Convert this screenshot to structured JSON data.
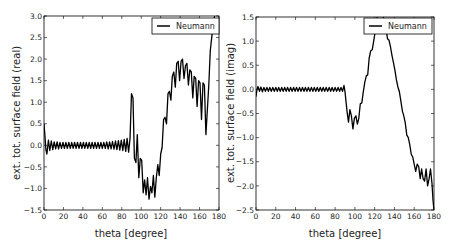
{
  "chart_data": [
    {
      "type": "line",
      "title": "",
      "xlabel": "theta [degree]",
      "ylabel": "ext. tot. surface field (real)",
      "xlim": [
        0,
        180
      ],
      "ylim": [
        -1.5,
        3.0
      ],
      "xticks": [
        0,
        20,
        40,
        60,
        80,
        100,
        120,
        140,
        160,
        180
      ],
      "yticks": [
        -1.5,
        -1.0,
        -0.5,
        0.0,
        0.5,
        1.0,
        1.5,
        2.0,
        2.5,
        3.0
      ],
      "ytick_labels": [
        "−1.5",
        "−1.0",
        "−0.5",
        "0.0",
        "0.5",
        "1.0",
        "1.5",
        "2.0",
        "2.5",
        "3.0"
      ],
      "xtick_labels": [
        "0",
        "20",
        "40",
        "60",
        "80",
        "100",
        "120",
        "140",
        "160",
        "180"
      ],
      "grid": false,
      "legend_position": "upper right",
      "series": [
        {
          "name": "Neumann",
          "color": "#000000",
          "x": [
            0,
            1,
            2,
            3,
            4.5,
            6,
            7.5,
            9,
            10.5,
            12,
            13.5,
            15,
            16.5,
            18,
            19.5,
            21,
            22.5,
            24,
            25.5,
            27,
            28.5,
            30,
            31.5,
            33,
            34.5,
            36,
            37.5,
            39,
            40.5,
            42,
            43.5,
            45,
            46.5,
            48,
            49.5,
            51,
            52.5,
            54,
            55.5,
            57,
            58.5,
            60,
            61.5,
            63,
            64.5,
            66,
            67.5,
            69,
            70.5,
            72,
            73.5,
            75,
            76.5,
            78,
            79.5,
            81,
            82.5,
            84,
            85.5,
            87,
            88.5,
            90,
            91.5,
            93,
            94.5,
            96,
            97.5,
            99,
            100.5,
            102,
            103.5,
            105,
            106.5,
            108,
            109.5,
            111,
            112.5,
            114,
            115.5,
            117,
            118.5,
            120,
            121.5,
            123,
            124.5,
            126,
            127.5,
            129,
            130.5,
            132,
            133.5,
            135,
            136.5,
            138,
            139.5,
            141,
            142.5,
            144,
            145.5,
            147,
            148.5,
            150,
            151.5,
            153,
            154.5,
            156,
            157.5,
            159,
            160.5,
            162,
            163.5,
            165,
            166.5,
            168,
            169.5,
            171,
            172.5,
            174,
            175.5,
            177,
            178,
            179,
            180
          ],
          "y": [
            0.5,
            0.2,
            -0.1,
            -0.2,
            0.12,
            -0.12,
            0.1,
            -0.1,
            0.08,
            -0.08,
            0.08,
            -0.08,
            0.07,
            -0.07,
            0.07,
            -0.07,
            0.07,
            -0.07,
            0.07,
            -0.07,
            0.07,
            -0.07,
            0.07,
            -0.07,
            0.07,
            -0.07,
            0.07,
            -0.07,
            0.07,
            -0.07,
            0.07,
            -0.07,
            0.07,
            -0.07,
            0.07,
            -0.07,
            0.07,
            -0.07,
            0.07,
            -0.07,
            0.07,
            -0.07,
            0.07,
            -0.07,
            0.08,
            -0.08,
            0.08,
            -0.08,
            0.09,
            -0.09,
            0.1,
            -0.1,
            0.11,
            -0.11,
            0.12,
            -0.12,
            0.14,
            -0.14,
            0.16,
            -0.16,
            0.15,
            1.2,
            1.1,
            -0.3,
            -0.4,
            0.25,
            -0.75,
            -0.3,
            -0.35,
            -1.1,
            -0.8,
            -1.15,
            -0.75,
            -1.25,
            -0.95,
            -1.1,
            -0.7,
            -1.2,
            -0.75,
            -0.45,
            -0.7,
            -0.2,
            -0.05,
            0.6,
            0.65,
            0.5,
            1.2,
            1.25,
            1.05,
            1.6,
            1.7,
            1.35,
            1.9,
            1.95,
            1.5,
            1.95,
            2.0,
            1.55,
            1.85,
            1.9,
            1.4,
            1.75,
            1.7,
            1.1,
            1.6,
            1.55,
            0.9,
            1.5,
            1.45,
            0.6,
            1.45,
            1.4,
            0.25,
            0.8,
            1.4,
            2.2,
            2.5,
            2.8,
            3.0
          ],
          "note": "x/y arrays after 87 are approximate traces of dense oscillation"
        }
      ]
    },
    {
      "type": "line",
      "title": "",
      "xlabel": "theta [degree]",
      "ylabel": "ext. tot. surface field (imag)",
      "xlim": [
        0,
        180
      ],
      "ylim": [
        -2.5,
        1.5
      ],
      "xticks": [
        0,
        20,
        40,
        60,
        80,
        100,
        120,
        140,
        160,
        180
      ],
      "yticks": [
        -2.5,
        -2.0,
        -1.5,
        -1.0,
        -0.5,
        0.0,
        0.5,
        1.0,
        1.5
      ],
      "ytick_labels": [
        "−2.5",
        "−2.0",
        "−1.5",
        "−1.0",
        "−0.5",
        "0.0",
        "0.5",
        "1.0",
        "1.5"
      ],
      "xtick_labels": [
        "0",
        "20",
        "40",
        "60",
        "80",
        "100",
        "120",
        "140",
        "160",
        "180"
      ],
      "grid": false,
      "legend_position": "upper right",
      "series": [
        {
          "name": "Neumann",
          "color": "#000000",
          "x": [
            0,
            1,
            2,
            3.5,
            5,
            6.5,
            8,
            9.5,
            11,
            12.5,
            14,
            15.5,
            17,
            18.5,
            20,
            21.5,
            23,
            24.5,
            26,
            27.5,
            29,
            30.5,
            32,
            33.5,
            35,
            36.5,
            38,
            39.5,
            41,
            42.5,
            44,
            45.5,
            47,
            48.5,
            50,
            51.5,
            53,
            54.5,
            56,
            57.5,
            59,
            60.5,
            62,
            63.5,
            65,
            66.5,
            68,
            69.5,
            71,
            72.5,
            74,
            75.5,
            77,
            78.5,
            80,
            81.5,
            83,
            84.5,
            86,
            87.5,
            89,
            90,
            92,
            93.5,
            95,
            96.5,
            98,
            99.5,
            101,
            102.5,
            104,
            105.5,
            107,
            108.5,
            110,
            111.5,
            113,
            114.5,
            116,
            117.5,
            119,
            120.5,
            122,
            124,
            126,
            128,
            130,
            131.5,
            133,
            134.5,
            136,
            137.5,
            139,
            140.5,
            142,
            143.5,
            145,
            146.5,
            148,
            149.5,
            151,
            152.5,
            154,
            155.5,
            157,
            158.5,
            160,
            161.5,
            163,
            164.5,
            166,
            167.5,
            169,
            170.5,
            172,
            173.5,
            175,
            176.5,
            178,
            179,
            180
          ],
          "y": [
            -0.15,
            0.0,
            0.06,
            -0.04,
            0.05,
            -0.05,
            0.04,
            -0.04,
            0.04,
            -0.04,
            0.04,
            -0.04,
            0.04,
            -0.04,
            0.04,
            -0.04,
            0.04,
            -0.04,
            0.04,
            -0.04,
            0.04,
            -0.04,
            0.04,
            -0.04,
            0.04,
            -0.04,
            0.04,
            -0.04,
            0.04,
            -0.04,
            0.04,
            -0.04,
            0.04,
            -0.04,
            0.04,
            -0.04,
            0.04,
            -0.04,
            0.04,
            -0.04,
            0.04,
            -0.04,
            0.04,
            -0.04,
            0.04,
            -0.04,
            0.04,
            -0.04,
            0.04,
            -0.04,
            0.04,
            -0.04,
            0.04,
            -0.04,
            0.04,
            -0.04,
            0.04,
            -0.04,
            0.04,
            -0.04,
            0.08,
            -0.05,
            -0.45,
            -0.68,
            -0.42,
            -0.55,
            -0.82,
            -0.6,
            -0.55,
            -0.72,
            -0.6,
            -0.3,
            -0.28,
            -0.05,
            0.15,
            0.28,
            0.3,
            0.65,
            0.8,
            0.82,
            1.0,
            1.2,
            1.45,
            1.6,
            1.7,
            1.55,
            1.4,
            1.25,
            1.05,
            1.02,
            0.88,
            0.7,
            0.55,
            0.4,
            0.2,
            0.05,
            -0.05,
            -0.25,
            -0.45,
            -0.55,
            -0.7,
            -0.95,
            -1.0,
            -1.15,
            -1.35,
            -1.4,
            -1.55,
            -1.7,
            -1.55,
            -1.6,
            -1.85,
            -1.65,
            -1.85,
            -1.9,
            -1.65,
            -2.0,
            -1.85,
            -1.65,
            -1.95,
            -2.3,
            -2.5
          ],
          "note": "approximate trace"
        }
      ]
    }
  ],
  "legend_label": "Neumann"
}
